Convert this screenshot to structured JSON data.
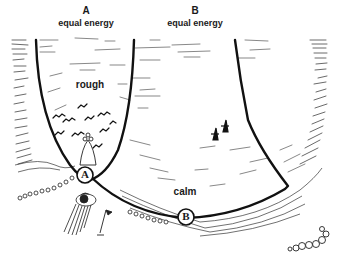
{
  "figure": {
    "channel_a": {
      "letter": "A",
      "subtitle": "equal energy",
      "region_label": "rough",
      "marker": "A"
    },
    "channel_b": {
      "letter": "B",
      "subtitle": "equal energy",
      "region_label": "calm",
      "marker": "B"
    },
    "colors": {
      "ink": "#1a1a1a",
      "background": "#ffffff",
      "hatch": "#444444"
    }
  }
}
